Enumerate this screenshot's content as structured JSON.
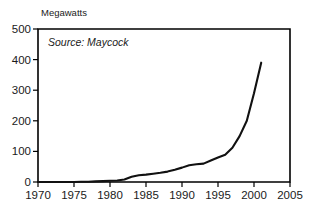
{
  "chart_data": {
    "type": "line",
    "title": "",
    "ylabel": "Megawatts",
    "xlabel": "",
    "annotation": "Source: Maycock",
    "xlim": [
      1970,
      2005
    ],
    "ylim": [
      0,
      500
    ],
    "grid": false,
    "legend": "none",
    "xticks": [
      "1970",
      "1975",
      "1980",
      "1985",
      "1990",
      "1995",
      "2000",
      "2005"
    ],
    "yticks": [
      "0",
      "100",
      "200",
      "300",
      "400",
      "500"
    ],
    "x": [
      1970,
      1975,
      1976,
      1977,
      1978,
      1979,
      1980,
      1981,
      1982,
      1983,
      1984,
      1985,
      1986,
      1987,
      1988,
      1989,
      1990,
      1991,
      1992,
      1993,
      1994,
      1995,
      1996,
      1997,
      1998,
      1999,
      2000,
      2001
    ],
    "values": [
      0,
      0,
      1,
      1,
      2,
      3,
      4,
      5,
      8,
      17,
      22,
      24,
      27,
      30,
      34,
      40,
      47,
      55,
      58,
      60,
      70,
      80,
      89,
      112,
      150,
      200,
      290,
      390
    ],
    "series": [
      {
        "name": "World photovoltaic production",
        "values": [
          0,
          0,
          1,
          1,
          2,
          3,
          4,
          5,
          8,
          17,
          22,
          24,
          27,
          30,
          34,
          40,
          47,
          55,
          58,
          60,
          70,
          80,
          89,
          112,
          150,
          200,
          290,
          390
        ]
      }
    ],
    "colors": {
      "line": "#111111",
      "axis": "#000000",
      "background": "#ffffff"
    }
  }
}
